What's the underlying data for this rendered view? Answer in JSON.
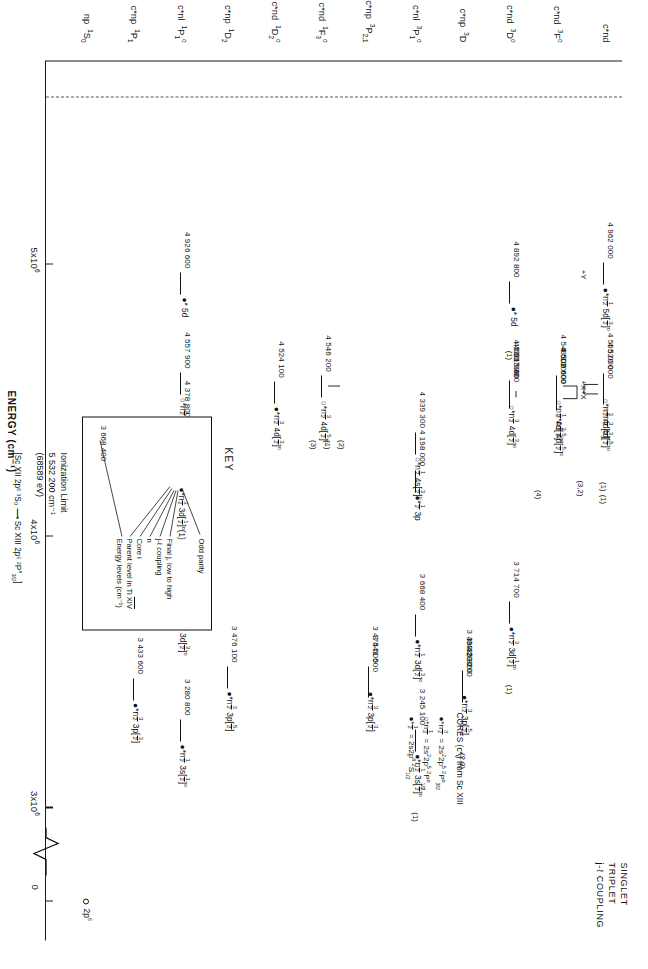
{
  "figure": {
    "ylabel": "ENERGY (cm-1)",
    "ylabel_html": "ENERGY (cm&#8315;&#185;)"
  },
  "axis": {
    "ticks": [
      {
        "label": "5x10",
        "exp": "6",
        "value": 5000000
      },
      {
        "label": "4x10",
        "exp": "6",
        "value": 4000000
      },
      {
        "label": "3x10",
        "exp": "6",
        "value": 3000000
      },
      {
        "label": "0",
        "exp": "",
        "value": 0
      }
    ],
    "range_min": 2900000,
    "range_max": 5600000,
    "break_near_zero": true
  },
  "legend": {
    "line1": "SINGLET",
    "line2": "TRIPLET",
    "line3": "j-ℓ  COUPLING"
  },
  "columns": [
    {
      "id": "np1S0",
      "label": "np &nbsp;<sup>1</sup>S<sub>0</sub>"
    },
    {
      "id": "cnp1P1",
      "label": "c*np &nbsp;<sup>1</sup>P<sub>1</sub>"
    },
    {
      "id": "cnl1P1o",
      "label": "c*nl &nbsp;<sup>1</sup>P<sub>1</sub><sup>o</sup>"
    },
    {
      "id": "cnp1D2",
      "label": "c*np &nbsp;<sup>1</sup>D<sub>2</sub>"
    },
    {
      "id": "cnd1D2o",
      "label": "c*nd &nbsp;<sup>1</sup>D<sub>2</sub><sup>o</sup>"
    },
    {
      "id": "cnd1F3o",
      "label": "c*nd &nbsp;<sup>1</sup>F<sub>3</sub><sup>o</sup>"
    },
    {
      "id": "cnp3P21",
      "label": "c*np &nbsp;<sup>3</sup>P<sub>2,1</sub>"
    },
    {
      "id": "cnl3P1o",
      "label": "c*nl &nbsp;<sup>3</sup>P<sub>1</sub><sup>o</sup>"
    },
    {
      "id": "cnp3D",
      "label": "c*np &nbsp;<sup>3</sup>D"
    },
    {
      "id": "cnd3Do",
      "label": "c*nd &nbsp;<sup>3</sup>D<sup>o</sup>"
    },
    {
      "id": "cnd3Fo",
      "label": "c*nd &nbsp;<sup>3</sup>F<sup>o</sup>"
    },
    {
      "id": "cnd",
      "label": "c*nd"
    }
  ],
  "levels": [
    {
      "col": "np1S0",
      "energy": 0,
      "number": "",
      "term": "2p<sup>6</sup>",
      "ring": true
    },
    {
      "col": "cnp1P1",
      "energy": 3433600,
      "number": "3 433 600",
      "term": "&#9679;*n<span class='frac'><b>3</b><i>2</i></span> 3p[<span class='frac'><b>3</b><i>2</i></span>]"
    },
    {
      "col": "cnl1P1o",
      "energy": 3280800,
      "number": "3 280 800",
      "term": "&#9679;*n<span class='frac'><b>1</b><i>2</i></span> 3s[<span class='frac'><b>1</b><i>2</i></span>]<sup>o</sup>"
    },
    {
      "col": "cnl1P1o",
      "energy": 3767300,
      "number": "3 767 300",
      "term": "&#9679;*n<span class='frac'><b>1</b><i>2</i></span> 3d[<span class='frac'><b>3</b><i>2</i></span>]<sup>o</sup>"
    },
    {
      "col": "cnl1P1o",
      "energy": 4215000,
      "number": "4 215 000",
      "term": "&#9679;*<span class='frac'><b>1</b><i>2</i></span> 3p"
    },
    {
      "col": "cnl1P1o",
      "energy": 4378800,
      "number": "4 378 800",
      "term": "&#9675;*n<span class='frac'><b>1</b><i>2</i></span> 4s[<span class='frac'><b>1</b><i>2</i></span>]<sup>o</sup>"
    },
    {
      "col": "cnl1P1o",
      "energy": 4557900,
      "number": "4 557 900",
      "term": "&#9675;*n<span class='frac'><b>1</b><i>2</i></span> 4d[<span class='frac'><b>3</b><i>2</i></span>]<sup>o</sup>"
    },
    {
      "col": "cnl1P1o",
      "energy": 4926600,
      "number": "4 926 600",
      "term": "&#9679;* 5d"
    },
    {
      "col": "cnp1D2",
      "energy": 3476100,
      "number": "3 476 100",
      "term": "&#9679;*n<span class='frac'><b>3</b><i>2</i></span> 3p[<span class='frac'><b>5</b><i>2</i></span>]"
    },
    {
      "col": "cnd1D2o",
      "energy": 4524100,
      "number": "4 524 100",
      "term": "&#9679;*n<span class='frac'><b>3</b><i>2</i></span> 4d[<span class='frac'><b>3</b><i>2</i></span>]<sup>o</sup>"
    },
    {
      "col": "cnd1F3o",
      "energy": 4546200,
      "number": "4 546 200",
      "term": "&#9675;*n<span class='frac'><b>3</b><i>2</i></span> 4d[<span class='frac'><b>5</b><i>2</i></span>]<sup>o</sup>"
    },
    {
      "col": "cnp3P21",
      "energy": 3475500,
      "number": "3 475 500",
      "term": "&#9679;*n<span class='frac'><b>3</b><i>2</i></span> 3p[<span class='frac'><b>3</b><i>2</i></span>]"
    },
    {
      "col": "cnp3P21",
      "energy": 3441500,
      "number": "3 441 500",
      "term": ""
    },
    {
      "col": "cnl3P1o",
      "energy": 3245100,
      "number": "3 245 100",
      "term": "&#9679;*n<span class='frac'><b>1</b><i>2</i></span> 3s[<span class='frac'><b>1</b><i>2</i></span>]<sup>o</sup>"
    },
    {
      "col": "cnl3P1o",
      "energy": 3668400,
      "number": "3 668 400",
      "term": "&#9679;*n<span class='frac'><b>1</b><i>2</i></span> 3d[<span class='frac'><b>3</b><i>2</i></span>]<sup>o</sup>"
    },
    {
      "col": "cnl3P1o",
      "energy": 4198000,
      "number": "4 198 000",
      "term": "&#9679;*<span class='frac'><b>1</b><i>2</i></span> 3p"
    },
    {
      "col": "cnl3P1o",
      "energy": 4339300,
      "number": "4 339 300",
      "term": "&#9675;*n<span class='frac'><b>1</b><i>2</i></span> 4s[<span class='frac'><b>3</b><i>2</i></span>]<sup>o</sup>"
    },
    {
      "col": "cnp3D",
      "energy": 3463200,
      "number": "3 463 200",
      "term": "&#9679;*n<span class='frac'><b>3</b><i>2</i></span> 3p[<span class='frac'><b>5</b><i>2</i></span>]"
    },
    {
      "col": "cnp3D",
      "energy": 3435800,
      "number": "3 435 800",
      "term": ""
    },
    {
      "col": "cnp3D",
      "energy": 3423200,
      "number": "3 423 200",
      "term": ""
    },
    {
      "col": "cnd3Do",
      "energy": 3714700,
      "number": "3 714 700",
      "term": "&#9679;*n<span class='frac'><b>3</b><i>2</i></span> 3d[<span class='frac'><b>1</b><i>2</i></span>]<sup>o</sup>"
    },
    {
      "col": "cnd3Do",
      "energy": 4507400,
      "number": "4 507 400",
      "term": ""
    },
    {
      "col": "cnd3Do",
      "energy": 4521000,
      "number": "4 521 000",
      "term": ""
    },
    {
      "col": "cnd3Do",
      "energy": 4530500,
      "number": "4 530 500",
      "term": "&#9675;*n<span class='frac'><b>3</b><i>2</i></span> 4d[<span class='frac'><b>3</b><i>2</i></span>]<sup>o</sup>"
    },
    {
      "col": "cnd3Do",
      "energy": 4892800,
      "number": "4 892 800",
      "term": "&#9679;* 5d"
    },
    {
      "col": "cnd3Fo",
      "energy": 4500600,
      "number": "4 500 600",
      "term": "&#9675;*n<span class='frac'><b>3</b><i>2</i></span> 4d[<span class='frac'><b>5</b><i>2</i></span>]<sup>o</sup>"
    },
    {
      "col": "cnd3Fo",
      "energy": 4502600,
      "number": "4 502 600",
      "term": ""
    },
    {
      "col": "cnd3Fo",
      "energy": 4549100,
      "number": "4 549 100",
      "term": "&#9675;*n<span class='frac'><b>1</b><i>2</i></span> 4d[<span class='frac'><b>5</b><i>2</i></span>]<sup>o</sup>"
    },
    {
      "col": "cnd",
      "energy": 4520000,
      "number": "4 520 000",
      "term": "&#9675;*n<span class='frac'><b>3</b><i>2</i></span> 4d[<span class='frac'><b>5</b><i>2</i></span>]<sup>o</sup>"
    },
    {
      "col": "cnd",
      "energy": 4555000,
      "number": "4 555 000",
      "term": "&#9675;*n<span class='frac'><b>3</b><i>2</i></span> 4d[<span class='frac'><b>3</b><i>2</i></span>]<sup>o</sup>"
    },
    {
      "col": "cnd",
      "energy": 4962000,
      "number": "4 962 000",
      "term": "&#9679;*n<span class='frac'><b>1</b><i>2</i></span> 5d[<span class='frac'><b>3</b><i>2</i></span>]<sup>o</sup>"
    }
  ],
  "annotations": {
    "plus_x_1": "+X",
    "plus_x_2": "+X",
    "plus_y": "+Y",
    "mult_1": "(1)",
    "mult_2": "(2)",
    "mult_3": "(3)",
    "mult_4": "(4)",
    "mult_32": "(3,2)",
    "mult_23": "(2,3)",
    "j_half": "[<span class='frac'><b>1</b><i>2</i></span>]<sup>o</sup>",
    "j_3half": "[<span class='frac'><b>3</b><i>2</i></span>]<sup>o</sup>",
    "j_5half": "[<span class='frac'><b>5</b><i>2</i></span>]<sup>o</sup>"
  },
  "key": {
    "title": "KEY",
    "sample_energy": "3 668 400",
    "sample_term": "&#9679;*n<span class='frac'><b>3</b><i>2</i></span> 3d[<span class='frac'><b>1</b><i>2</i></span>]<sup>o</sup>(1)",
    "items": [
      "Odd parity",
      "Final j, low to high",
      "j-ℓ coupling",
      "n",
      "Core i",
      "Parent level in Ti XIV",
      "Energy levels (cm-1)"
    ]
  },
  "cores": {
    "heading": "CORES (c*ⱼ) from Sc XIII",
    "lines": [
      {
        "sym": "&#9679;*n<span class='frac'><b>3</b><i>2</i></span>",
        "eq": "= 2s<sup>2</sup>2p<sup>5</sup>",
        "term": "<sup>2</sup>P<sup>o</sup><sub>3/2</sub>"
      },
      {
        "sym": "&#9675;*n<span class='frac'><b>1</b><i>2</i></span>",
        "eq": "= 2s<sup>2</sup>2p<sup>5</sup>",
        "term": "<sup>2</sup>P<sup>o</sup><sub>1/2</sub>"
      },
      {
        "sym": "&#9679;*<span class='frac'><b>1</b><i>2</i></span>",
        "eq": "= 2s2p<sup>6</sup>",
        "term": "<sup>2</sup>S<sub>1/2</sub>"
      }
    ]
  },
  "ionization": {
    "label": "Ionization Limit",
    "value": "5 532 200 cm-1",
    "value_ev": "(68589 eV)",
    "transition": "[Sc XII 2p⁶ ¹S₀  ⟶  Sc XIII 2p⁵ ²P°<sub>3/2</sub>]"
  }
}
